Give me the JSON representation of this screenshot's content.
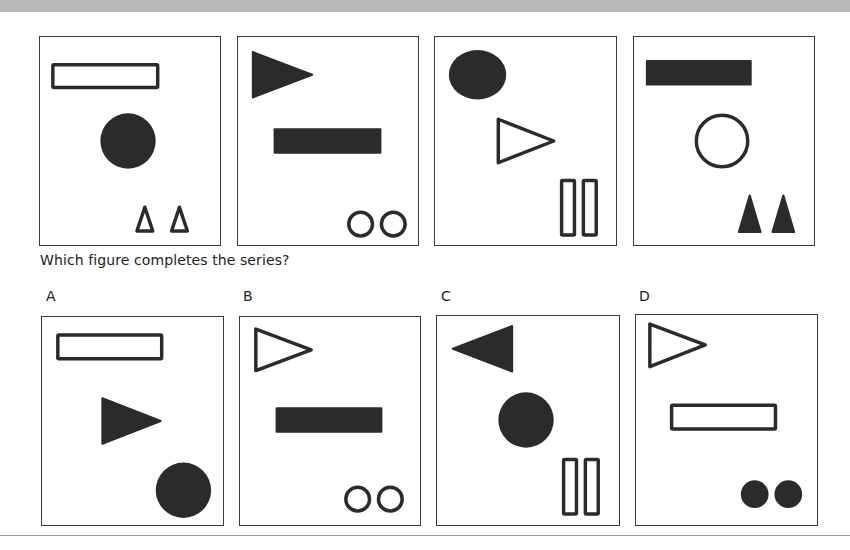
{
  "question": "Which figure completes the series?",
  "colors": {
    "ink": "#2b2b2b",
    "frame": "#3a3a3a",
    "banner": "#b9b9b9"
  },
  "series": [
    {
      "index": 1,
      "shapes": [
        "outline-rectangle (top-left)",
        "filled-circle (center)",
        "two outline-triangles-up (bottom-right)"
      ]
    },
    {
      "index": 2,
      "shapes": [
        "filled-triangle-right (top-left)",
        "filled-rectangle (center)",
        "two outline-circles (bottom-right)"
      ]
    },
    {
      "index": 3,
      "shapes": [
        "filled-circle (top-left)",
        "outline-triangle-right (center)",
        "two outline-vertical-bars (bottom-right)"
      ]
    },
    {
      "index": 4,
      "shapes": [
        "filled-rectangle (top-left)",
        "outline-circle (center)",
        "two filled-triangles-up (bottom-right)"
      ]
    }
  ],
  "options": [
    {
      "label": "A",
      "shapes": [
        "outline-rectangle (top-left)",
        "filled-triangle-right (center)",
        "filled-circle (bottom-right)"
      ]
    },
    {
      "label": "B",
      "shapes": [
        "outline-triangle-right (top-left)",
        "filled-rectangle (center)",
        "two outline-circles (bottom-right)"
      ]
    },
    {
      "label": "C",
      "shapes": [
        "filled-triangle-left (top-left)",
        "filled-circle (center)",
        "two outline-vertical-bars (bottom-right)"
      ]
    },
    {
      "label": "D",
      "shapes": [
        "outline-triangle-right (top-left)",
        "outline-rectangle (center)",
        "two filled-circles (bottom-right)"
      ]
    }
  ]
}
